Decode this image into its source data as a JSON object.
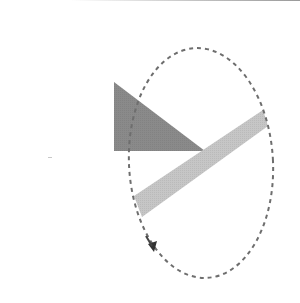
{
  "diagram": {
    "colors": {
      "triangle": "#8a8a8a",
      "bar": "#c6c6c6",
      "orbit": "#6e6e6e",
      "arrow": "#333333",
      "background": "#ffffff"
    },
    "shapes": {
      "triangle": {
        "points": [
          [
            114,
            82
          ],
          [
            114,
            151
          ],
          [
            205,
            151
          ]
        ]
      },
      "bar": {
        "points": [
          [
            134,
            196
          ],
          [
            263,
            110
          ],
          [
            268,
            126
          ],
          [
            142,
            217
          ]
        ]
      },
      "orbit": {
        "cx": 201,
        "cy": 163,
        "rx": 72,
        "ry": 115,
        "style": "dashed"
      },
      "arrow": {
        "tip": [
          153,
          251
        ],
        "direction": "down-right"
      }
    }
  }
}
